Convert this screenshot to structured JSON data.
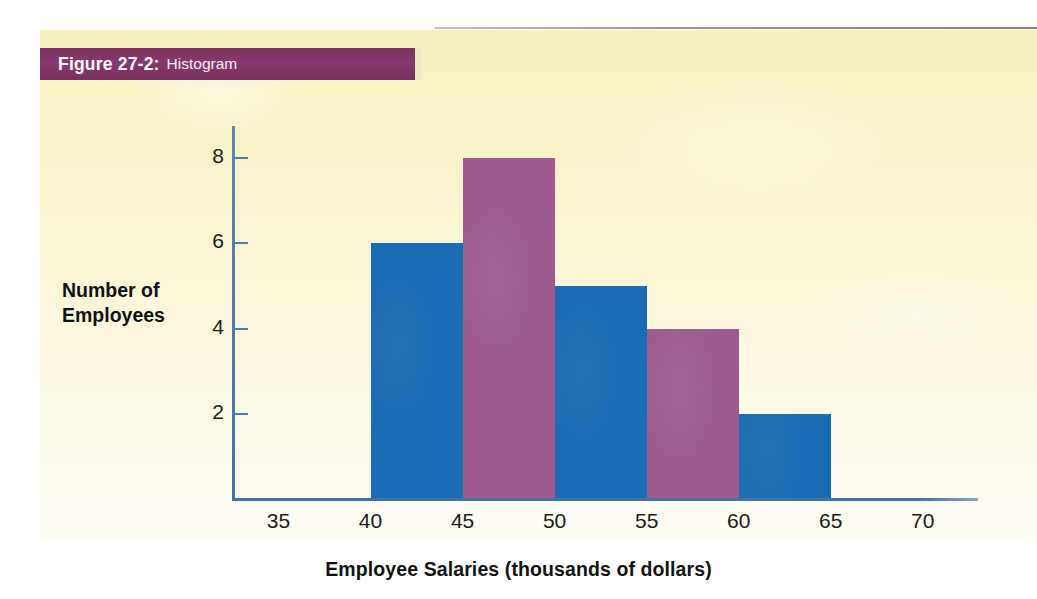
{
  "figure": {
    "number_label": "Figure 27-2:",
    "caption": "Histogram",
    "title_bar_color": "#7c3263",
    "panel_color_top": "#f6efbe",
    "panel_color_bottom": "#fefdf5"
  },
  "chart_data": {
    "type": "bar",
    "title": "Histogram",
    "xlabel": "Employee Salaries (thousands of dollars)",
    "ylabel": "Number of Employees",
    "ylabel_lines": [
      "Number of",
      "Employees"
    ],
    "grid": false,
    "legend": "none",
    "xlim": [
      32.5,
      73
    ],
    "ylim": [
      0,
      8.8
    ],
    "x_tick_labels": [
      "35",
      "40",
      "45",
      "50",
      "55",
      "60",
      "65",
      "70"
    ],
    "x_ticks": [
      35,
      40,
      45,
      50,
      55,
      60,
      65,
      70
    ],
    "y_tick_labels": [
      "2",
      "4",
      "6",
      "8"
    ],
    "y_ticks": [
      2,
      4,
      6,
      8
    ],
    "bin_edges": [
      40,
      45,
      50,
      55,
      60,
      65
    ],
    "categories": [
      "40-45",
      "45-50",
      "50-55",
      "55-60",
      "60-65"
    ],
    "values": [
      6,
      8,
      5,
      4,
      2
    ],
    "bar_colors": [
      "#1a6cb3",
      "#9d5c8d",
      "#1a6cb3",
      "#9d5c8d",
      "#1a6cb3"
    ],
    "axis_color": "#3f73a8"
  }
}
